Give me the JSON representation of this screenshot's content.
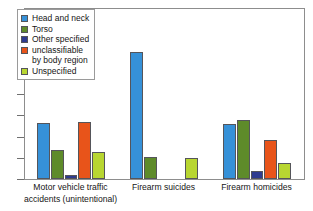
{
  "chart_data": {
    "type": "bar",
    "title": "",
    "subtitle": "",
    "xlabel": "",
    "ylabel": "",
    "grid": false,
    "legend_position": "top-left",
    "y_axis": {
      "labeled": false,
      "tick_count": 8,
      "ylim": [
        0,
        176
      ],
      "note": "Y axis shows unlabeled tick marks only"
    },
    "categories": [
      "Motor vehicle traffic accidents (unintentional)",
      "Firearm suicides",
      "Firearm homicides"
    ],
    "category_lines": [
      [
        "Motor vehicle traffic",
        "accidents (unintentional)"
      ],
      [
        "Firearm suicides",
        ""
      ],
      [
        "Firearm homicides",
        ""
      ]
    ],
    "series": [
      {
        "name": "Head and neck",
        "color": "#3691D8",
        "values": [
          58,
          132,
          57
        ]
      },
      {
        "name": "Torso",
        "color": "#5E8B2A",
        "values": [
          30,
          23,
          61
        ]
      },
      {
        "name": "Other specified",
        "color": "#2E3B8F",
        "values": [
          4,
          0,
          8
        ]
      },
      {
        "name": "unclassifiable by body region",
        "name_line1": "unclassifiable",
        "name_line2": "by body region",
        "color": "#E8541A",
        "values": [
          59,
          0,
          40
        ]
      },
      {
        "name": "Unspecified",
        "color": "#B8D631",
        "values": [
          28,
          22,
          17
        ]
      }
    ]
  },
  "legend": {
    "items": [
      {
        "label": "Head and neck",
        "label2": "",
        "color": "#3691D8"
      },
      {
        "label": "Torso",
        "label2": "",
        "color": "#5E8B2A"
      },
      {
        "label": "Other specified",
        "label2": "",
        "color": "#2E3B8F"
      },
      {
        "label": "unclassifiable",
        "label2": "by body region",
        "color": "#E8541A"
      },
      {
        "label": "Unspecified",
        "label2": "",
        "color": "#B8D631"
      }
    ]
  }
}
